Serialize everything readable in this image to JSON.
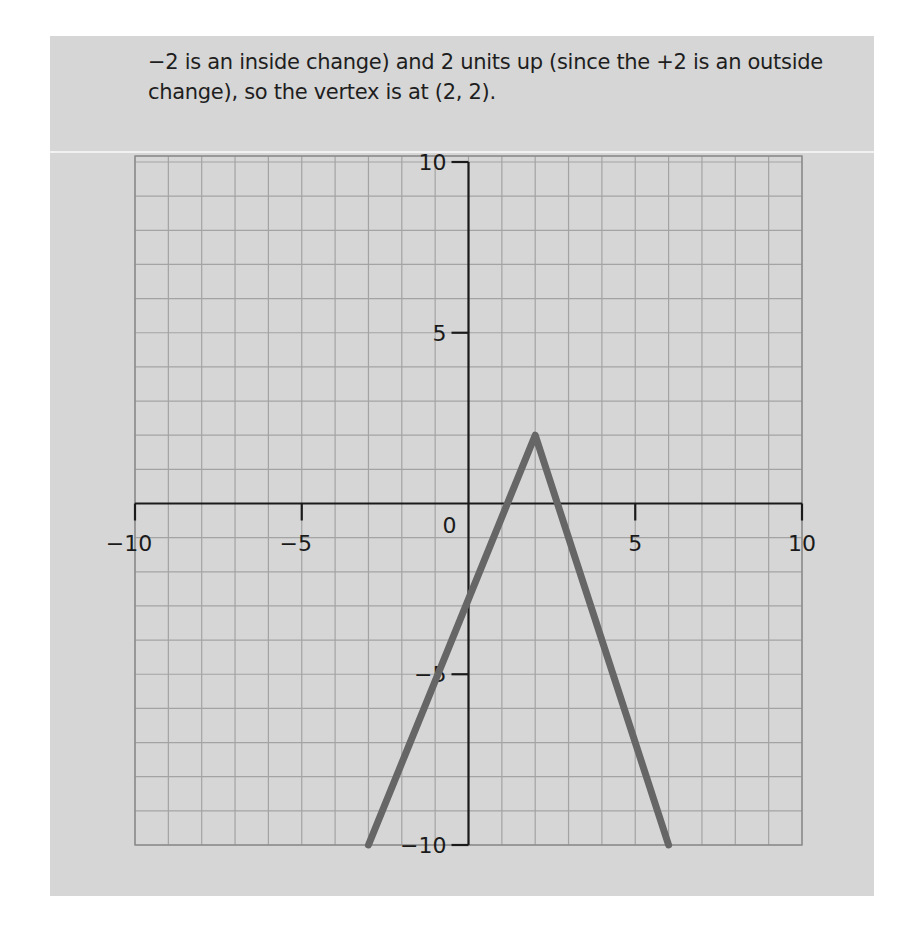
{
  "caption": {
    "line1": "−2 is an inside change) and 2 units up (since the +2 is an outside",
    "line2": "change), so the vertex is at (2, 2)."
  },
  "colors": {
    "panel_background": "#d6d6d6",
    "grid": "#a3a3a3",
    "axis": "#1a1a1a",
    "graph_line": "#666666"
  },
  "chart_data": {
    "type": "line",
    "title": "",
    "xlabel": "",
    "ylabel": "",
    "xlim": [
      -10,
      10
    ],
    "ylim": [
      -10,
      10
    ],
    "grid": true,
    "grid_step": 1,
    "x_tick_labels": [
      "-10",
      "-5",
      "0",
      "5",
      "10"
    ],
    "y_tick_labels": [
      "10",
      "5",
      "-5",
      "-10"
    ],
    "x_ticks": [
      -10,
      -5,
      5,
      10
    ],
    "y_ticks": [
      10,
      5,
      -5,
      -10
    ],
    "origin_label": "0",
    "series": [
      {
        "name": "absolute value graph (vertex at (2, 2))",
        "x": [
          -3,
          2,
          6
        ],
        "y": [
          -10,
          2,
          -10
        ]
      }
    ],
    "annotations": [
      "vertex at (2, 2)"
    ]
  }
}
